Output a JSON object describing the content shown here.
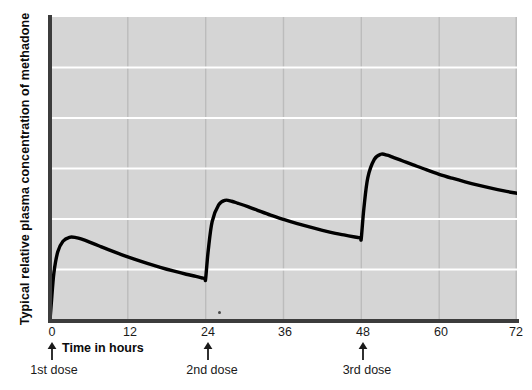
{
  "chart_data": {
    "type": "line",
    "title": "",
    "subtitle": "",
    "xlabel": "Time in hours",
    "ylabel": "Typical relative plasma concentration of methadone",
    "xlim": [
      0,
      72
    ],
    "ylim": [
      0,
      10
    ],
    "xticks": [
      0,
      12,
      24,
      36,
      48,
      60,
      72
    ],
    "xticklabels": [
      "0",
      "12",
      "24",
      "36",
      "48",
      "60",
      "72"
    ],
    "yticks": [],
    "yticklabels": [],
    "grid": {
      "vertical": true,
      "vertical_at": [
        12,
        24,
        36,
        48,
        60,
        72
      ],
      "horizontal": true,
      "horizontal_count": 5,
      "horizontal_color": "#ffffff",
      "vertical_color": "#bcbcbc"
    },
    "legend": null,
    "plot_background": "#d5d5d5",
    "line_color": "#000000",
    "line_width": 3,
    "annotations": [
      {
        "label": "1st dose",
        "x": 0
      },
      {
        "label": "2nd dose",
        "x": 24
      },
      {
        "label": "3rd dose",
        "x": 48
      }
    ],
    "series": [
      {
        "name": "Plasma methadone concentration",
        "x": [
          0,
          0.2,
          0.6,
          1.2,
          2.0,
          3.0,
          4.0,
          5.0,
          6.0,
          7.5,
          9.0,
          11.0,
          13.0,
          15.0,
          17.0,
          19.0,
          21.0,
          22.5,
          23.6,
          23.9,
          24.0,
          24.4,
          25.0,
          26.0,
          27.0,
          28.0,
          29.0,
          30.5,
          32.0,
          34.0,
          36.0,
          38.0,
          40.0,
          42.0,
          44.0,
          45.5,
          47.0,
          47.6,
          47.9,
          48.0,
          48.4,
          49.0,
          50.0,
          51.0,
          52.0,
          53.0,
          54.5,
          56.0,
          58.0,
          60.0,
          62.0,
          64.0,
          66.0,
          68.0,
          70.0,
          72.0
        ],
        "y": [
          0.0,
          0.55,
          1.55,
          2.25,
          2.6,
          2.73,
          2.72,
          2.66,
          2.58,
          2.45,
          2.32,
          2.16,
          2.01,
          1.87,
          1.74,
          1.62,
          1.51,
          1.44,
          1.38,
          1.37,
          1.37,
          2.3,
          3.25,
          3.8,
          3.95,
          3.92,
          3.85,
          3.74,
          3.62,
          3.46,
          3.32,
          3.19,
          3.07,
          2.96,
          2.86,
          2.8,
          2.74,
          2.72,
          2.71,
          2.71,
          3.7,
          4.7,
          5.3,
          5.47,
          5.44,
          5.36,
          5.24,
          5.12,
          4.96,
          4.81,
          4.68,
          4.56,
          4.45,
          4.35,
          4.26,
          4.18
        ]
      }
    ]
  },
  "axis": {
    "y_title": "Typical relative plasma concentration of methadone",
    "x_title": "Time in hours",
    "x_tick_labels": [
      "0",
      "12",
      "24",
      "36",
      "48",
      "60",
      "72"
    ]
  },
  "doses": [
    {
      "label": "1st dose",
      "hour": 0
    },
    {
      "label": "2nd dose",
      "hour": 24
    },
    {
      "label": "3rd dose",
      "hour": 48
    }
  ]
}
